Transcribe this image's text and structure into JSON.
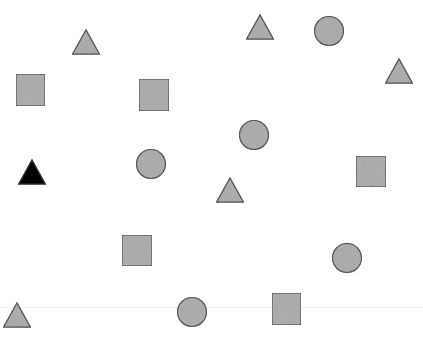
{
  "canvas": {
    "width": 423,
    "height": 339,
    "background": "#ffffff"
  },
  "colors": {
    "gray_fill": "#a9a9a9",
    "stroke": "#3a3a3a",
    "black_fill": "#000000"
  },
  "shapes": [
    {
      "type": "triangle",
      "cx": 86,
      "cy": 42,
      "size": 27,
      "fill": "gray"
    },
    {
      "type": "triangle",
      "cx": 260,
      "cy": 27,
      "size": 27,
      "fill": "gray"
    },
    {
      "type": "circle",
      "cx": 329,
      "cy": 31,
      "r": 14.5,
      "fill": "gray"
    },
    {
      "type": "triangle",
      "cx": 399,
      "cy": 71,
      "size": 27,
      "fill": "gray"
    },
    {
      "type": "square",
      "x": 16,
      "y": 74,
      "w": 29,
      "h": 32,
      "fill": "gray"
    },
    {
      "type": "square",
      "x": 139,
      "y": 79,
      "w": 30,
      "h": 32,
      "fill": "gray"
    },
    {
      "type": "circle",
      "cx": 254,
      "cy": 135,
      "r": 14.5,
      "fill": "gray"
    },
    {
      "type": "triangle",
      "cx": 32,
      "cy": 172,
      "size": 27,
      "fill": "black"
    },
    {
      "type": "circle",
      "cx": 151,
      "cy": 164,
      "r": 14.5,
      "fill": "gray"
    },
    {
      "type": "triangle",
      "cx": 230,
      "cy": 190,
      "size": 27,
      "fill": "gray"
    },
    {
      "type": "square",
      "x": 356,
      "y": 156,
      "w": 30,
      "h": 31,
      "fill": "gray"
    },
    {
      "type": "square",
      "x": 122,
      "y": 235,
      "w": 30,
      "h": 31,
      "fill": "gray"
    },
    {
      "type": "circle",
      "cx": 347,
      "cy": 258,
      "r": 14.5,
      "fill": "gray"
    },
    {
      "type": "triangle",
      "cx": 17,
      "cy": 315,
      "size": 27,
      "fill": "gray"
    },
    {
      "type": "circle",
      "cx": 192,
      "cy": 312,
      "r": 14.5,
      "fill": "gray"
    },
    {
      "type": "square",
      "x": 272,
      "y": 293,
      "w": 29,
      "h": 32,
      "fill": "gray"
    }
  ]
}
